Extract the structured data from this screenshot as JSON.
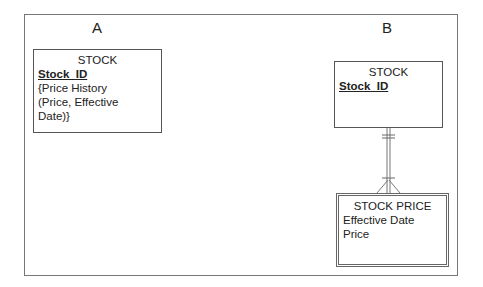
{
  "diagram": {
    "panels": [
      {
        "label": "A",
        "entities": [
          {
            "name": "STOCK",
            "key": "Stock_ID",
            "attributes": [
              "{Price History",
              "(Price, Effective",
              "Date)}"
            ]
          }
        ]
      },
      {
        "label": "B",
        "entities": [
          {
            "name": "STOCK",
            "key": "Stock_ID",
            "attributes": []
          },
          {
            "name": "STOCK PRICE",
            "type": "weak entity",
            "attributes": [
              "Effective Date",
              "Price"
            ]
          }
        ],
        "relationships": [
          {
            "from": "STOCK",
            "to": "STOCK PRICE",
            "from_cardinality": "one and only one",
            "to_cardinality": "one or many"
          }
        ]
      }
    ]
  },
  "colors": {
    "line": "#666666",
    "text": "#222222",
    "background": "#ffffff"
  }
}
